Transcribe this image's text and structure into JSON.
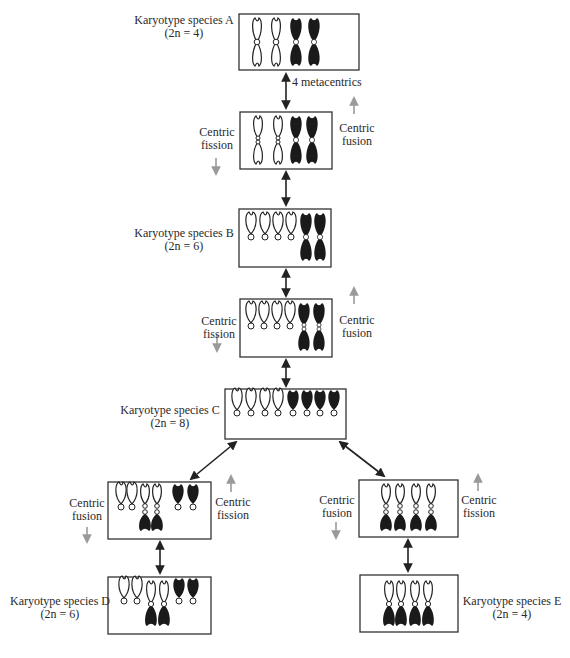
{
  "diagram": {
    "title": "",
    "colors": {
      "line": "#222222",
      "gray_arrow": "#9a9a9a",
      "open_chromosome": "#ffffff",
      "dark_chromosome": "#1a1a1a"
    },
    "boxes": [
      {
        "id": "A",
        "label_line1": "Karyotype species A",
        "label_line2": "(2n = 4)",
        "chromosomes": [
          "open-meta",
          "open-meta",
          "dark-meta",
          "dark-meta"
        ]
      },
      {
        "id": "AB",
        "label_line1": "",
        "label_line2": "",
        "chromosomes": [
          "open-meta-split",
          "open-meta-split",
          "dark-meta",
          "dark-meta"
        ]
      },
      {
        "id": "B",
        "label_line1": "Karyotype species B",
        "label_line2": "(2n = 6)",
        "chromosomes": [
          "open-acro",
          "open-acro",
          "open-acro",
          "open-acro",
          "dark-meta",
          "dark-meta"
        ]
      },
      {
        "id": "BC",
        "label_line1": "",
        "label_line2": "",
        "chromosomes": [
          "open-acro",
          "open-acro",
          "open-acro",
          "open-acro",
          "dark-meta-split",
          "dark-meta-split"
        ]
      },
      {
        "id": "C",
        "label_line1": "Karyotype species C",
        "label_line2": "(2n = 8)",
        "chromosomes": [
          "open-acro",
          "open-acro",
          "open-acro",
          "open-acro",
          "dark-acro",
          "dark-acro",
          "dark-acro",
          "dark-acro"
        ]
      },
      {
        "id": "CD",
        "label_line1": "",
        "label_line2": "",
        "chromosomes": [
          "open-acro",
          "open-acro",
          "joined-pair",
          "joined-pair",
          "dark-acro",
          "dark-acro"
        ]
      },
      {
        "id": "D",
        "label_line1": "Karyotype species D",
        "label_line2": "(2n = 6)",
        "chromosomes": [
          "open-acro",
          "open-acro",
          "joined-meta",
          "joined-meta",
          "dark-acro",
          "dark-acro"
        ]
      },
      {
        "id": "CE",
        "label_line1": "",
        "label_line2": "",
        "chromosomes": [
          "joined-pair",
          "joined-pair",
          "joined-pair",
          "joined-pair"
        ]
      },
      {
        "id": "E",
        "label_line1": "Karyotype species E",
        "label_line2": "(2n = 4)",
        "chromosomes": [
          "joined-meta",
          "joined-meta",
          "joined-meta",
          "joined-meta"
        ]
      }
    ],
    "annotations": {
      "metacentrics": "4 metacentrics",
      "ab_left_line1": "Centric",
      "ab_left_line2": "fission",
      "ab_right_line1": "Centric",
      "ab_right_line2": "fusion",
      "bc_left_line1": "Centric",
      "bc_left_line2": "fission",
      "bc_right_line1": "Centric",
      "bc_right_line2": "fusion",
      "cd_left_line1": "Centric",
      "cd_left_line2": "fusion",
      "cd_right_line1": "Centric",
      "cd_right_line2": "fission",
      "ce_left_line1": "Centric",
      "ce_left_line2": "fusion",
      "ce_right_line1": "Centric",
      "ce_right_line2": "fission"
    }
  }
}
